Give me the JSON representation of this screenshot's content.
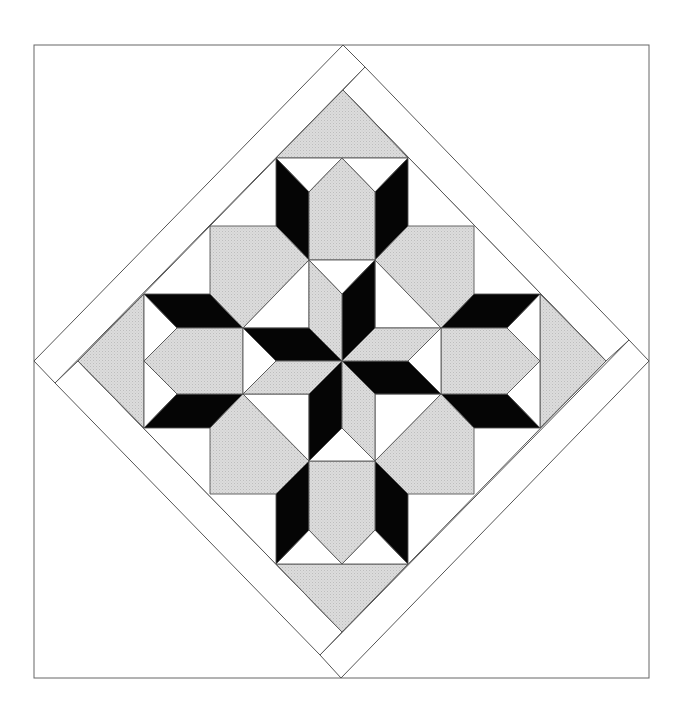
{
  "colors": {
    "background": "#ffffff",
    "gray": "#d6d6d6",
    "black": "#050505",
    "white": "#ffffff",
    "line": "#555555"
  },
  "frame": {
    "x1": 34,
    "y1": 45,
    "x2": 649,
    "y2": 678
  },
  "border_strips": [
    {
      "name": "strip-top-left",
      "points": "343,45 365,67 55,383 34,361"
    },
    {
      "name": "strip-top-right",
      "points": "365,67 629,340 606,361 343,90"
    },
    {
      "name": "strip-bottom-right",
      "points": "649,361 341,678 320,655 629,340"
    },
    {
      "name": "strip-bottom-left",
      "points": "55,383 78,361 342,632 320,655"
    }
  ],
  "inner_diamond": "343,90 606,361 342,632 78,361",
  "shapes": [
    {
      "name": "gray-triangle-top",
      "fill": "gray",
      "points": "343,90 408,158 276,158"
    },
    {
      "name": "gray-triangle-right",
      "fill": "gray",
      "points": "606,361 540,428 540,294"
    },
    {
      "name": "gray-triangle-bottom",
      "fill": "gray",
      "points": "342,632 276,564 408,564"
    },
    {
      "name": "gray-triangle-left",
      "fill": "gray",
      "points": "78,361 144,294 144,428"
    },
    {
      "name": "top-arm-white-left",
      "fill": "white",
      "points": "276,158 342,158 309,192"
    },
    {
      "name": "top-arm-white-right",
      "fill": "white",
      "points": "342,158 408,158 375,192"
    },
    {
      "name": "top-arm-black-left",
      "fill": "black",
      "points": "276,158 309,192 309,260 276,226"
    },
    {
      "name": "top-arm-black-right",
      "fill": "black",
      "points": "408,158 408,226 375,260 375,192"
    },
    {
      "name": "top-arm-gray-hex",
      "fill": "gray",
      "points": "309,192 342,158 375,192 375,260 309,260"
    },
    {
      "name": "bottom-arm-white-left",
      "fill": "white",
      "points": "276,564 342,564 309,530"
    },
    {
      "name": "bottom-arm-white-right",
      "fill": "white",
      "points": "342,564 408,564 375,530"
    },
    {
      "name": "bottom-arm-black-left",
      "fill": "black",
      "points": "276,564 309,530 309,461 276,494"
    },
    {
      "name": "bottom-arm-black-right",
      "fill": "black",
      "points": "408,564 408,494 375,461 375,530"
    },
    {
      "name": "bottom-arm-gray-hex",
      "fill": "gray",
      "points": "309,530 342,564 375,530 375,461 309,461"
    },
    {
      "name": "left-arm-white-top",
      "fill": "white",
      "points": "144,294 177,328 144,361"
    },
    {
      "name": "left-arm-white-bottom",
      "fill": "white",
      "points": "144,361 177,394 144,428"
    },
    {
      "name": "left-arm-black-top",
      "fill": "black",
      "points": "144,294 210,294 243,328 177,328"
    },
    {
      "name": "left-arm-black-bottom",
      "fill": "black",
      "points": "177,394 243,394 210,428 144,428"
    },
    {
      "name": "left-arm-gray-hex",
      "fill": "gray",
      "points": "177,328 243,328 243,394 177,394 144,361"
    },
    {
      "name": "right-arm-white-top",
      "fill": "white",
      "points": "540,294 507,328 540,361"
    },
    {
      "name": "right-arm-white-bottom",
      "fill": "white",
      "points": "540,361 507,394 540,428"
    },
    {
      "name": "right-arm-black-top",
      "fill": "black",
      "points": "474,294 540,294 507,328 441,328"
    },
    {
      "name": "right-arm-black-bottom",
      "fill": "black",
      "points": "441,394 507,394 540,428 474,428"
    },
    {
      "name": "right-arm-gray-hex",
      "fill": "gray",
      "points": "441,328 507,328 540,361 507,394 441,394"
    },
    {
      "name": "gray-octagon-upper-left",
      "fill": "gray",
      "points": "210,226 276,226 309,260 243,328 210,294"
    },
    {
      "name": "gray-octagon-upper-right",
      "fill": "gray",
      "points": "408,226 474,226 474,294 441,328 375,260"
    },
    {
      "name": "gray-octagon-lower-left",
      "fill": "gray",
      "points": "243,394 309,461 276,494 210,494 210,428"
    },
    {
      "name": "gray-octagon-lower-right",
      "fill": "gray",
      "points": "441,394 474,428 474,494 408,494 375,461"
    },
    {
      "name": "center-white-upper-left",
      "fill": "white",
      "points": "309,260 243,328 309,328"
    },
    {
      "name": "center-white-upper-right",
      "fill": "white",
      "points": "375,260 441,328 375,328"
    },
    {
      "name": "center-white-lower-left",
      "fill": "white",
      "points": "243,394 309,394 309,461"
    },
    {
      "name": "center-white-lower-right",
      "fill": "white",
      "points": "441,394 375,394 375,461"
    },
    {
      "name": "star-white-top",
      "fill": "white",
      "points": "309,260 375,260 342,294"
    },
    {
      "name": "star-white-right",
      "fill": "white",
      "points": "441,328 408,361 441,394"
    },
    {
      "name": "star-white-bottom",
      "fill": "white",
      "points": "375,461 309,461 342,428"
    },
    {
      "name": "star-white-left",
      "fill": "white",
      "points": "243,394 276,361 243,328"
    },
    {
      "name": "star-black-blade-top",
      "fill": "black",
      "points": "375,260 342,294 342,361 375,328"
    },
    {
      "name": "star-gray-blade-top",
      "fill": "gray",
      "points": "309,260 342,294 342,361 309,328"
    },
    {
      "name": "star-black-blade-right",
      "fill": "black",
      "points": "342,361 408,361 441,394 375,394"
    },
    {
      "name": "star-gray-blade-right",
      "fill": "gray",
      "points": "342,361 375,328 441,328 408,361"
    },
    {
      "name": "star-black-blade-bottom",
      "fill": "black",
      "points": "309,461 342,428 342,361 309,394"
    },
    {
      "name": "star-gray-blade-bottom",
      "fill": "gray",
      "points": "375,461 342,428 342,361 375,394"
    },
    {
      "name": "star-black-blade-left",
      "fill": "black",
      "points": "342,361 276,361 243,328 309,328"
    },
    {
      "name": "star-gray-blade-left",
      "fill": "gray",
      "points": "342,361 309,394 243,394 276,361"
    }
  ]
}
